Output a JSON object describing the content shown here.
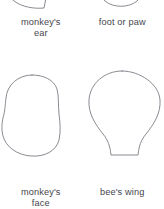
{
  "sheet": {
    "title": "Shape template reference sheet",
    "background_color": "#ffffff",
    "stroke_color": "#7d7d86",
    "fill_color": "#ffffff",
    "text_color": "#45454c",
    "columns": 2,
    "rows": 2
  },
  "figures": [
    {
      "id": "monkeys-ear",
      "caption": "monkey's\near",
      "caption_line1": "monkey's",
      "caption_line2": "ear",
      "position": "top-left",
      "cropped": true,
      "crop_edge": "top",
      "shape_name": "monkeys-ear-outline"
    },
    {
      "id": "foot-or-paw",
      "caption": "foot or paw",
      "caption_line1": "foot or paw",
      "caption_line2": "",
      "position": "top-right",
      "cropped": true,
      "crop_edge": "top",
      "shape_name": "foot-or-paw-outline"
    },
    {
      "id": "monkeys-face",
      "caption": "monkey's\nface",
      "caption_line1": "monkey's",
      "caption_line2": "face",
      "position": "bottom-left",
      "cropped": false,
      "crop_edge": "",
      "shape_name": "monkeys-face-outline"
    },
    {
      "id": "bees-wing",
      "caption": "bee's wing",
      "caption_line1": "bee's wing",
      "caption_line2": "",
      "position": "bottom-right",
      "cropped": false,
      "crop_edge": "",
      "shape_name": "bees-wing-outline"
    }
  ]
}
